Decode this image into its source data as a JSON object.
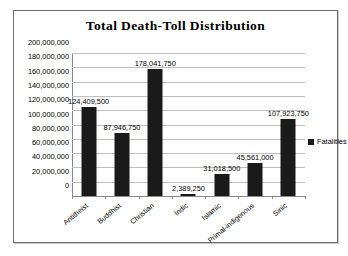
{
  "chart_data": {
    "type": "bar",
    "title": "Total Death-Toll Distribution",
    "xlabel": "",
    "ylabel": "",
    "categories": [
      "Antitheist",
      "Buddhist",
      "Christian",
      "Indic",
      "Islamic",
      "Primal-indigenous",
      "Sinic"
    ],
    "values": [
      124409500,
      87946750,
      178041750,
      2389250,
      31018500,
      45561000,
      107923750
    ],
    "data_labels": [
      "124,409,500",
      "87,946,750",
      "178,041,750",
      "2,389,250",
      "31,018,500",
      "45,561,000",
      "107,923,750"
    ],
    "series": [
      {
        "name": "Fatalities",
        "values": [
          124409500,
          87946750,
          178041750,
          2389250,
          31018500,
          45561000,
          107923750
        ]
      }
    ],
    "ylim": [
      0,
      200000000
    ],
    "ytick_step": 20000000,
    "ytick_labels": [
      "200,000,000",
      "180,000,000",
      "160,000,000",
      "140,000,000",
      "120,000,000",
      "100,000,000",
      "80,000,000",
      "60,000,000",
      "40,000,000",
      "20,000,000",
      "0"
    ],
    "grid": true,
    "legend_position": "right",
    "bar_color": "#1a1a1a",
    "gridline_color": "#bfbfbf",
    "plot_background": "#ffffff"
  },
  "legend": {
    "entries": [
      {
        "label": "Fatalities",
        "color": "#1a1a1a"
      }
    ]
  }
}
